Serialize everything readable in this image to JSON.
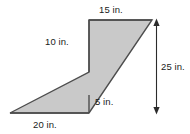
{
  "figure": {
    "kind": "geometry-diagram",
    "shape_name": "zigzag-polygon",
    "fill_color": "#c9c9c9",
    "stroke_color": "#4d4d4d",
    "text_color": "#1a1a1a",
    "background_color": "#ffffff",
    "labels": {
      "top": "15 in.",
      "left": "10 in.",
      "right": "25 in.",
      "notch": "5 in.",
      "bottom": "20 in."
    },
    "dimension_arrow": {
      "name": "height-dimension-arrow",
      "value": "25 in.",
      "orientation": "vertical",
      "double_headed": true
    },
    "polygon_points": "89,20 152,20 89,113 10,113 89,72"
  }
}
